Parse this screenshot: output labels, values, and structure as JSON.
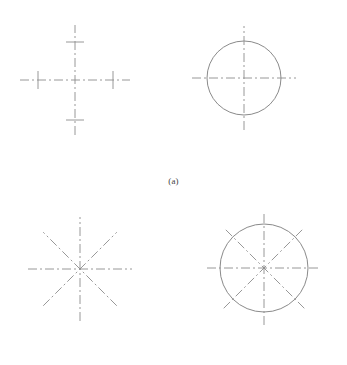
{
  "figure": {
    "background_color": "#ffffff",
    "line_color": "#8c8c8c",
    "circle_color": "#7d7d7d",
    "caption_color": "#444444",
    "width": 347,
    "height": 365
  },
  "panels": [
    {
      "id": "a",
      "caption": "(a)",
      "description": "Single pair of perpendicular centerlines",
      "figures": [
        {
          "id": "a-left",
          "name": "cross-centerline-with-ticks",
          "center": {
            "x": 75,
            "y": 80
          },
          "has_circle": false,
          "lines": [
            {
              "name": "vertical-centerline",
              "angle_deg": 90,
              "half_length": 55
            },
            {
              "name": "horizontal-centerline",
              "angle_deg": 0,
              "half_length": 55
            }
          ],
          "ticks": [
            {
              "name": "tick-top",
              "at_x": 75,
              "at_y": 42,
              "orientation": "horizontal",
              "length": 18
            },
            {
              "name": "tick-bottom",
              "at_x": 75,
              "at_y": 120,
              "orientation": "horizontal",
              "length": 18
            },
            {
              "name": "tick-left",
              "at_x": 38,
              "at_y": 80,
              "orientation": "vertical",
              "length": 18
            },
            {
              "name": "tick-right",
              "at_x": 113,
              "at_y": 80,
              "orientation": "vertical",
              "length": 18
            }
          ]
        },
        {
          "id": "a-right",
          "name": "circle-with-cross-centerlines",
          "center": {
            "x": 244,
            "y": 78
          },
          "has_circle": true,
          "circle_radius": 37,
          "lines": [
            {
              "name": "vertical-centerline",
              "angle_deg": 90,
              "half_length": 52
            },
            {
              "name": "horizontal-centerline",
              "angle_deg": 0,
              "half_length": 52
            }
          ],
          "ticks": []
        }
      ]
    },
    {
      "id": "b",
      "caption": "(b)",
      "description": "Four centerlines at forty-five degree intervals forming eight spokes",
      "figures": [
        {
          "id": "b-left",
          "name": "radial-centerlines-eight-spokes",
          "center": {
            "x": 80,
            "y": 269
          },
          "has_circle": false,
          "lines": [
            {
              "name": "horizontal-centerline",
              "angle_deg": 0,
              "half_length": 52
            },
            {
              "name": "vertical-centerline",
              "angle_deg": 90,
              "half_length": 52
            },
            {
              "name": "diagonal-centerline-45",
              "angle_deg": 45,
              "half_length": 52
            },
            {
              "name": "diagonal-centerline-135",
              "angle_deg": 135,
              "half_length": 52
            }
          ],
          "ticks": []
        },
        {
          "id": "b-right",
          "name": "circle-with-radial-centerlines",
          "center": {
            "x": 264,
            "y": 268
          },
          "has_circle": true,
          "circle_radius": 44,
          "lines": [
            {
              "name": "horizontal-centerline",
              "angle_deg": 0,
              "half_length": 57
            },
            {
              "name": "vertical-centerline",
              "angle_deg": 90,
              "half_length": 57
            },
            {
              "name": "diagonal-centerline-45",
              "angle_deg": 45,
              "half_length": 57
            },
            {
              "name": "diagonal-centerline-135",
              "angle_deg": 135,
              "half_length": 57
            }
          ],
          "ticks": []
        }
      ]
    }
  ],
  "line_style": {
    "name": "dash-dot-chain",
    "stroke_width": 0.9,
    "dash_pattern": "9 3 2 3"
  }
}
